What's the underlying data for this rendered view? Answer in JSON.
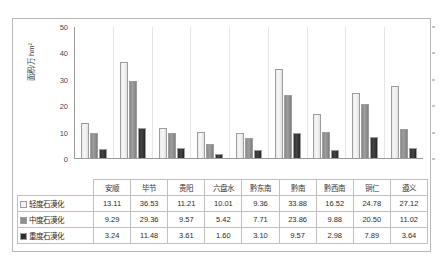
{
  "chart_data": {
    "type": "bar",
    "title": "",
    "xlabel": "",
    "ylabel": "面积/万 hm²",
    "ylim": [
      0,
      50
    ],
    "yticks": [
      0,
      10,
      20,
      30,
      40,
      50
    ],
    "grid": false,
    "legend_position": "table-row-labels",
    "categories": [
      "安顺",
      "毕节",
      "贵阳",
      "六盘水",
      "黔东南",
      "黔南",
      "黔西南",
      "铜仁",
      "遵义"
    ],
    "series": [
      {
        "name": "轻度石漠化",
        "swatch": "#f2f2f2",
        "values": [
          13.11,
          36.53,
          11.21,
          10.01,
          9.36,
          33.88,
          16.52,
          24.78,
          27.12
        ]
      },
      {
        "name": "中度石漠化",
        "swatch": "#8f8f8f",
        "values": [
          9.29,
          29.36,
          9.57,
          5.42,
          7.71,
          23.86,
          9.88,
          20.5,
          11.02
        ]
      },
      {
        "name": "重度石漠化",
        "swatch": "#2e2e2e",
        "values": [
          3.24,
          11.48,
          3.61,
          1.6,
          3.1,
          9.57,
          2.98,
          7.89,
          3.64
        ]
      }
    ]
  },
  "table": {
    "corner_label": "",
    "row_labels": [
      "轻度石漠化",
      "中度石漠化",
      "重度石漠化"
    ]
  }
}
